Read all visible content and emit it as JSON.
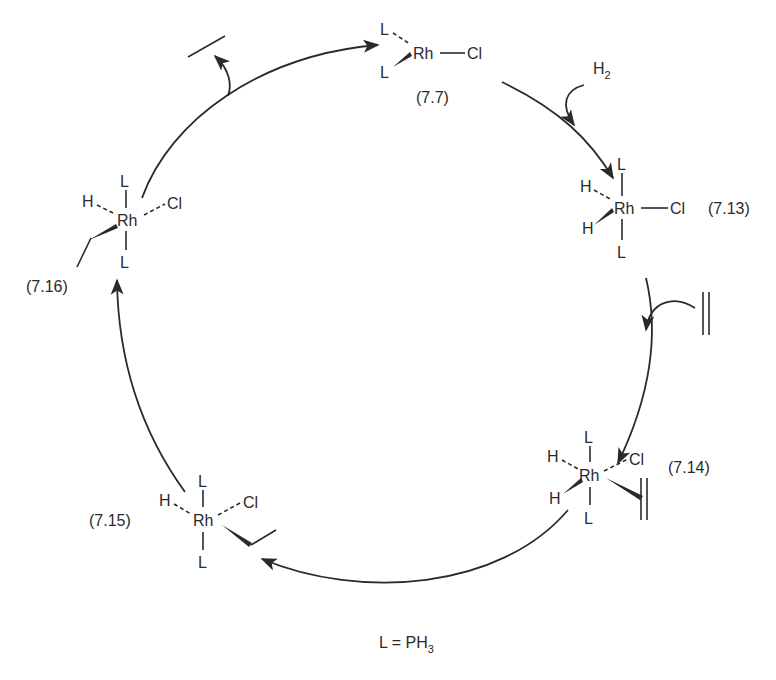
{
  "diagram": {
    "type": "catalytic-cycle",
    "legend": {
      "text": "L = PH",
      "subscript": "3"
    },
    "compounds": [
      {
        "id": "7.7",
        "label": "(7.7)",
        "metal": "Rh",
        "ligands": [
          "L",
          "L",
          "Cl"
        ]
      },
      {
        "id": "7.13",
        "label": "(7.13)",
        "metal": "Rh",
        "ligands": [
          "L",
          "L",
          "H",
          "H",
          "Cl"
        ]
      },
      {
        "id": "7.14",
        "label": "(7.14)",
        "metal": "Rh",
        "ligands": [
          "L",
          "L",
          "H",
          "H",
          "Cl",
          "ethylene"
        ]
      },
      {
        "id": "7.15",
        "label": "(7.15)",
        "metal": "Rh",
        "ligands": [
          "L",
          "L",
          "H",
          "Cl",
          "ethyl"
        ]
      },
      {
        "id": "7.16",
        "label": "(7.16)",
        "metal": "Rh",
        "ligands": [
          "L",
          "L",
          "H",
          "Cl",
          "ethyl"
        ]
      }
    ],
    "reagents": [
      {
        "name": "H",
        "subscript": "2",
        "role": "enters",
        "step": "7.7 -> 7.13"
      },
      {
        "name": "ethylene",
        "symbol": "double-bond",
        "role": "enters",
        "step": "7.13 -> 7.14"
      },
      {
        "name": "ethane",
        "symbol": "single-bond",
        "role": "leaves",
        "step": "7.16 -> 7.7"
      }
    ],
    "atoms": {
      "L": "L",
      "Rh": "Rh",
      "Cl": "Cl",
      "H": "H"
    }
  }
}
